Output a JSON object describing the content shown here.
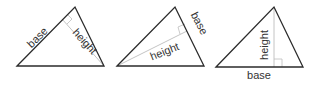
{
  "figure": {
    "triangles": [
      {
        "base_label": "base",
        "height_label": "height",
        "base_side": "left side",
        "height_orientation": "perpendicular from bottom-right vertex"
      },
      {
        "base_label": "base",
        "height_label": "height",
        "base_side": "right side",
        "height_orientation": "perpendicular from bottom-left vertex"
      },
      {
        "base_label": "base",
        "height_label": "height",
        "base_side": "bottom side",
        "height_orientation": "vertical from apex"
      }
    ]
  },
  "colors": {
    "edge": "#2b2b2b",
    "height": "#bdbdbd",
    "text": "#333333"
  }
}
